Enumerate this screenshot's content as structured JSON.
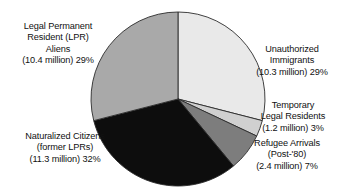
{
  "chart_data": {
    "type": "pie",
    "title": "",
    "subtitle": "",
    "xlabel": "",
    "ylabel": "",
    "legend_position": "none",
    "grid": false,
    "units": "millions of people",
    "categories": [
      "Unauthorized Immigrants",
      "Temporary Legal Residents",
      "Refugee Arrivals (Post-'80)",
      "Naturalized Citizens (former LPRs)",
      "Legal Permanent Resident (LPR) Aliens"
    ],
    "values": [
      29,
      3,
      7,
      32,
      29
    ],
    "value_labels": [
      "29%",
      "3%",
      "7%",
      "32%",
      "29%"
    ],
    "absolute_values": [
      10.3,
      1.2,
      2.4,
      11.3,
      10.4
    ],
    "absolute_value_labels": [
      "(10.3 million)",
      "(1.2 million)",
      "(2.4 million)",
      "(11.3 million)",
      "(10.4 million)"
    ],
    "colors": [
      "#e9e9e9",
      "#d0d0d0",
      "#7d7d7d",
      "#0d0d0d",
      "#a9a9a9"
    ],
    "start_angle_deg": 0,
    "direction": "clockwise",
    "slices": [
      {
        "name": "unauthorized-immigrants",
        "percent": 29,
        "millions": 10.3,
        "color": "#e9e9e9",
        "start_deg": 0,
        "end_deg": 104.4
      },
      {
        "name": "temporary-legal-residents",
        "percent": 3,
        "millions": 1.2,
        "color": "#d0d0d0",
        "start_deg": 104.4,
        "end_deg": 115.2
      },
      {
        "name": "refugee-arrivals",
        "percent": 7,
        "millions": 2.4,
        "color": "#7d7d7d",
        "start_deg": 115.2,
        "end_deg": 140.4
      },
      {
        "name": "naturalized-citizens",
        "percent": 32,
        "millions": 11.3,
        "color": "#0d0d0d",
        "start_deg": 140.4,
        "end_deg": 255.6
      },
      {
        "name": "legal-permanent-resident-aliens",
        "percent": 29,
        "millions": 10.4,
        "color": "#a9a9a9",
        "start_deg": 255.6,
        "end_deg": 360
      }
    ]
  },
  "labels": {
    "lpr": {
      "line1": "Legal Permanent",
      "line2": "Resident (LPR)",
      "line3": "Aliens",
      "line4": "(10.4 million) 29%"
    },
    "unauthorized": {
      "line1": "Unauthorized",
      "line2": "Immigrants",
      "line3": "(10.3 million) 29%"
    },
    "temporary": {
      "line1": "Temporary",
      "line2": "Legal Residents",
      "line3": "(1.2 million) 3%"
    },
    "refugee": {
      "line1": "Refugee Arrivals",
      "line2": "(Post-'80)",
      "line3": "(2.4 million) 7%"
    },
    "naturalized": {
      "line1": "Naturalized Citizens",
      "line2": "(former LPRs)",
      "line3": "(11.3 million) 32%"
    }
  },
  "style": {
    "background": "#ffffff",
    "text_color": "#111111",
    "slice_outline": "#2b2b2b"
  }
}
